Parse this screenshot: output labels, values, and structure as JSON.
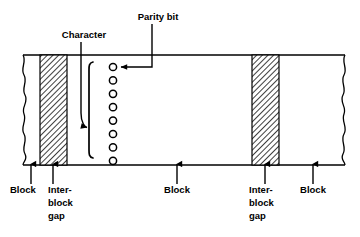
{
  "figure": {
    "background_color": "#ffffff",
    "line_color": "#000000",
    "hatch_color": "#000000",
    "hatch_fill_color": "#ffffff"
  },
  "callouts": {
    "character": {
      "label": "Character",
      "label_x": 84,
      "label_y": 38,
      "leader_from_x": 81,
      "leader_from_y": 42,
      "leader_to_x": 89,
      "leader_to_y": 128
    },
    "parity_bit": {
      "label": "Parity bit",
      "label_x": 158,
      "label_y": 20,
      "leader_from_x": 152,
      "leader_from_y": 24,
      "leader_to_x": 120,
      "leader_to_y": 67
    }
  },
  "bottom_labels": [
    {
      "id": "block-left",
      "lines": [
        "Block"
      ],
      "label_x": 24,
      "label_y": 193,
      "arrow_x": 31,
      "arrow_from_y": 184,
      "arrow_to_y": 164
    },
    {
      "id": "interblock-gap-left",
      "lines": [
        "Inter-",
        "block",
        "gap"
      ],
      "label_x": 48,
      "label_y": 193,
      "arrow_x": 53,
      "arrow_from_y": 184,
      "arrow_to_y": 164
    },
    {
      "id": "block-middle",
      "lines": [
        "Block"
      ],
      "label_x": 177,
      "label_y": 193,
      "arrow_x": 177,
      "arrow_from_y": 184,
      "arrow_to_y": 164
    },
    {
      "id": "interblock-gap-right",
      "lines": [
        "Inter-",
        "block",
        "gap"
      ],
      "label_x": 263,
      "label_y": 193,
      "arrow_x": 265,
      "arrow_from_y": 184,
      "arrow_to_y": 164
    },
    {
      "id": "block-right",
      "lines": [
        "Block"
      ],
      "label_x": 313,
      "label_y": 193,
      "arrow_x": 313,
      "arrow_from_y": 184,
      "arrow_to_y": 164
    }
  ],
  "tape": {
    "top_y": 55,
    "bottom_y": 165,
    "left_x": 23,
    "right_x": 345,
    "torn_left": true,
    "torn_right": true
  },
  "gaps": [
    {
      "id": "gap-left",
      "x": 40,
      "width": 27
    },
    {
      "id": "gap-right",
      "x": 252,
      "width": 27
    }
  ],
  "character_column": {
    "circle_count": 8,
    "circle_radius": 3.6,
    "center_x": 113,
    "first_center_y": 67,
    "spacing": 13.4,
    "parity_bit_index": 0,
    "bracket_x": 89,
    "bracket_top_y": 62,
    "bracket_bottom_y": 158
  }
}
